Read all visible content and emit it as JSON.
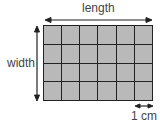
{
  "diagram": {
    "labels": {
      "length": "length",
      "width": "width",
      "unit": "1 cm"
    },
    "grid": {
      "columns": 6,
      "rows": 4,
      "cell_color": "#b9b9b9",
      "line_color": "#222222"
    },
    "arrows": [
      "length-arrow",
      "width-arrow",
      "unit-arrow"
    ]
  }
}
